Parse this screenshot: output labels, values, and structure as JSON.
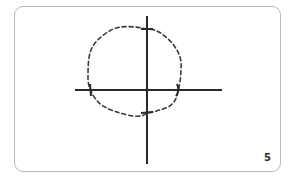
{
  "card": {
    "page_number": "5",
    "border_color": "#b9b9b9",
    "background": "#ffffff"
  },
  "diagram": {
    "axes_color": "#2a2a2a",
    "curve_color": "#3a3a3a",
    "curve_style": "dashed",
    "origin": [
      147,
      90
    ],
    "axis_crossings": {
      "top": [
        147,
        29
      ],
      "bottom": [
        147,
        113
      ],
      "left": [
        91,
        90
      ],
      "right": [
        177,
        90
      ]
    }
  }
}
